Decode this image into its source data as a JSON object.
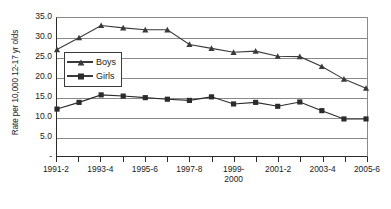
{
  "chart_data": {
    "type": "line",
    "title": "",
    "xlabel": "",
    "ylabel": "Rate per 10,000 12-17 yr olds",
    "ylim": [
      0,
      35
    ],
    "ytick_values": [
      0,
      5,
      10,
      15,
      20,
      25,
      30,
      35
    ],
    "ytick_labels": [
      "-",
      "5.0",
      "10.0",
      "15.0",
      "20.0",
      "25.0",
      "30.0",
      "35.0"
    ],
    "grid": true,
    "legend_position": "upper-left-inside",
    "categories": [
      "1991-2",
      "1992-3",
      "1993-4",
      "1994-5",
      "1995-6",
      "1996-7",
      "1997-8",
      "1998-9",
      "1999-2000",
      "2000-1",
      "2001-2",
      "2002-3",
      "2003-4",
      "2004-5",
      "2005-6"
    ],
    "xtick_labels_shown": [
      "1991-2",
      "",
      "1993-4",
      "",
      "1995-6",
      "",
      "1997-8",
      "",
      "1999-\n2000",
      "",
      "2001-2",
      "",
      "2003-4",
      "",
      "2005-6"
    ],
    "series": [
      {
        "name": "Boys",
        "marker": "triangle",
        "color": "#3a3a3a",
        "values": [
          27.0,
          30.0,
          33.1,
          32.5,
          32.0,
          32.0,
          28.3,
          27.3,
          26.3,
          26.6,
          25.3,
          25.2,
          22.7,
          19.5,
          17.2
        ]
      },
      {
        "name": "Girls",
        "marker": "square",
        "color": "#2b2b2b",
        "values": [
          11.9,
          13.6,
          15.5,
          15.2,
          14.8,
          14.4,
          14.1,
          15.0,
          13.2,
          13.6,
          12.6,
          13.7,
          11.5,
          9.4,
          9.4
        ]
      }
    ]
  },
  "legend": {
    "items": [
      {
        "label": "Boys"
      },
      {
        "label": "Girls"
      }
    ]
  }
}
